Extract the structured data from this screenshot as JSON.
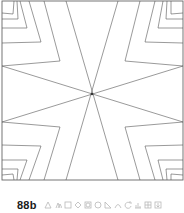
{
  "figure": {
    "label": "88b",
    "frame": {
      "x1": 2,
      "y1": 1,
      "x2": 183,
      "y2": 180
    },
    "center": [
      92,
      94
    ],
    "stroke_color": "#555555",
    "frame_color": "#666666",
    "center_lines": [
      [
        [
          66,
          1
        ],
        [
          118,
          180
        ]
      ],
      [
        [
          118,
          1
        ],
        [
          66,
          180
        ]
      ],
      [
        [
          2,
          66
        ],
        [
          183,
          122
        ]
      ],
      [
        [
          2,
          122
        ],
        [
          183,
          66
        ]
      ]
    ],
    "corner_folds": {
      "top_left": [
        {
          "apex": [
            60,
            61
          ],
          "top": [
            44,
            1
          ],
          "side": [
            2,
            66
          ]
        },
        {
          "apex": [
            41,
            42
          ],
          "top": [
            29,
            1
          ],
          "side": [
            2,
            43
          ]
        },
        {
          "apex": [
            27,
            28
          ],
          "top": [
            20,
            1
          ],
          "side": [
            2,
            28
          ]
        },
        {
          "apex": [
            18,
            19
          ],
          "top": [
            17,
            1
          ],
          "side": [
            2,
            19
          ]
        },
        {
          "apex": [
            13,
            14
          ],
          "top": [
            14,
            1
          ],
          "side": [
            2,
            13
          ]
        }
      ],
      "top_right": [
        {
          "apex": [
            125,
            61
          ],
          "top": [
            140,
            1
          ],
          "side": [
            183,
            66
          ]
        },
        {
          "apex": [
            145,
            42
          ],
          "top": [
            155,
            1
          ],
          "side": [
            183,
            43
          ]
        },
        {
          "apex": [
            158,
            28
          ],
          "top": [
            163,
            1
          ],
          "side": [
            183,
            28
          ]
        },
        {
          "apex": [
            166,
            19
          ],
          "top": [
            167,
            1
          ],
          "side": [
            183,
            19
          ]
        },
        {
          "apex": [
            171,
            14
          ],
          "top": [
            171,
            1
          ],
          "side": [
            183,
            13
          ]
        }
      ],
      "bottom_left": [
        {
          "apex": [
            60,
            127
          ],
          "bottom": [
            44,
            180
          ],
          "side": [
            2,
            122
          ]
        },
        {
          "apex": [
            41,
            146
          ],
          "bottom": [
            29,
            180
          ],
          "side": [
            2,
            145
          ]
        },
        {
          "apex": [
            27,
            160
          ],
          "bottom": [
            20,
            180
          ],
          "side": [
            2,
            160
          ]
        },
        {
          "apex": [
            18,
            169
          ],
          "bottom": [
            17,
            180
          ],
          "side": [
            2,
            169
          ]
        },
        {
          "apex": [
            13,
            174
          ],
          "bottom": [
            14,
            180
          ],
          "side": [
            2,
            175
          ]
        }
      ],
      "bottom_right": [
        {
          "apex": [
            125,
            127
          ],
          "bottom": [
            140,
            180
          ],
          "side": [
            183,
            122
          ]
        },
        {
          "apex": [
            145,
            146
          ],
          "bottom": [
            155,
            180
          ],
          "side": [
            183,
            145
          ]
        },
        {
          "apex": [
            158,
            160
          ],
          "bottom": [
            163,
            180
          ],
          "side": [
            183,
            160
          ]
        },
        {
          "apex": [
            166,
            169
          ],
          "bottom": [
            167,
            180
          ],
          "side": [
            183,
            169
          ]
        },
        {
          "apex": [
            171,
            174
          ],
          "bottom": [
            171,
            180
          ],
          "side": [
            183,
            175
          ]
        }
      ]
    }
  },
  "toolbar": {
    "icon_color": "#b8b8b8",
    "icons": [
      "triangle-icon",
      "triangle-pair-icon",
      "square-icon",
      "diamond-icon",
      "circle-square-icon",
      "circle-icon",
      "right-triangle-icon",
      "arc-icon",
      "rotate-icon",
      "bar-chart-icon",
      "grid-icon",
      "download-box-icon"
    ]
  }
}
